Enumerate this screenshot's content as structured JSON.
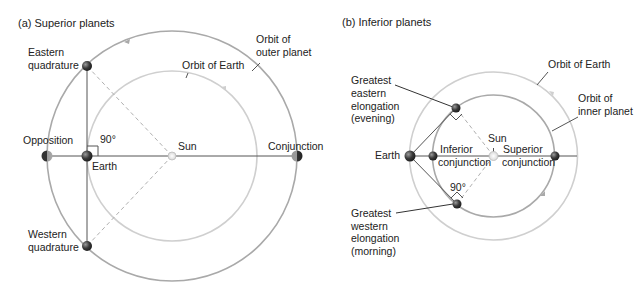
{
  "panel_a": {
    "title": "(a)  Superior planets",
    "labels": {
      "outer_orbit_1": "Orbit of",
      "outer_orbit_2": "outer planet",
      "earth_orbit": "Orbit of Earth",
      "eastern_1": "Eastern",
      "eastern_2": "quadrature",
      "opposition": "Opposition",
      "angle": "90°",
      "earth": "Earth",
      "sun": "Sun",
      "conjunction": "Conjunction",
      "western_1": "Western",
      "western_2": "quadrature"
    }
  },
  "panel_b": {
    "title": "(b)  Inferior planets",
    "labels": {
      "earth_orbit": "Orbit of Earth",
      "inner_orbit_1": "Orbit of",
      "inner_orbit_2": "inner planet",
      "gee_1": "Greatest",
      "gee_2": "eastern",
      "gee_3": "elongation",
      "gee_4": "(evening)",
      "sun": "Sun",
      "earth": "Earth",
      "inferior_1": "Inferior",
      "inferior_2": "conjunction",
      "superior_1": "Superior",
      "superior_2": "conjunction",
      "angle": "90°",
      "gwe_1": "Greatest",
      "gwe_2": "western",
      "gwe_3": "elongation",
      "gwe_4": "(morning)"
    }
  },
  "colors": {
    "outer_orbit": "#a9a9a9",
    "earth_orbit": "#cfcfcf",
    "inner_orbit": "#a9a9a9",
    "line": "#555555",
    "dash": "#b0b0b0",
    "planet": "#444444",
    "sun": "#e6e6e6"
  }
}
